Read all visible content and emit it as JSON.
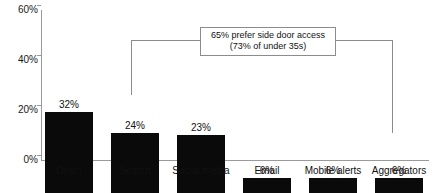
{
  "chart_data": {
    "type": "bar",
    "title": "",
    "subtitle": "",
    "xlabel": "",
    "ylabel": "",
    "ylim": [
      0,
      60
    ],
    "grid": false,
    "legend": "none",
    "y_ticks": [
      "0%",
      "20%",
      "40%",
      "60%"
    ],
    "y_tick_values": [
      0,
      20,
      40,
      60
    ],
    "categories": [
      "Direct",
      "Search",
      "Social media",
      "Email",
      "Mobile alerts",
      "Aggregators"
    ],
    "values": [
      32,
      24,
      23,
      6,
      6,
      6
    ],
    "value_labels": [
      "32%",
      "24%",
      "23%",
      "6%",
      "6%",
      "6%"
    ],
    "bar_color": "#0a0a0a",
    "axis_color": "#9a9a9a",
    "annotations": [
      {
        "line1": "65% prefer side door access",
        "line2": "(73% of under 35s)",
        "points_to": [
          "Search",
          "Aggregators"
        ]
      }
    ]
  }
}
